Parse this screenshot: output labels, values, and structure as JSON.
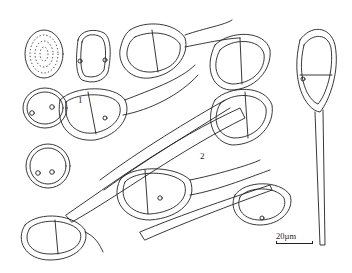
{
  "figure": {
    "panel_labels": [
      "1",
      "2"
    ],
    "scale_bar": {
      "label": "20µm"
    },
    "panels": [
      {
        "label": "1",
        "description": "Urediniospores: one surface view (verrucose/echinulate) and three optical sections with germ pores"
      },
      {
        "label": "2",
        "description": "Two-celled teliospores with long pedicels"
      }
    ]
  }
}
